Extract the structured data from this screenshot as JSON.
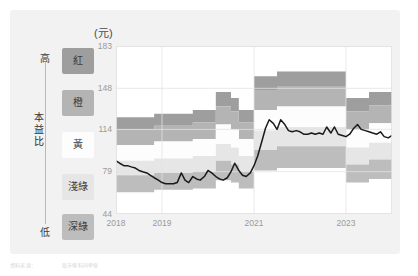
{
  "card": {
    "background": "#f2f2f2"
  },
  "legend": {
    "title_vertical": "本益比",
    "title_chars": [
      "本",
      "益",
      "比"
    ],
    "high_label": "高",
    "low_label": "低",
    "bands": [
      {
        "label": "紅",
        "color": "#9e9e9e",
        "text_color": "#3c3c3c"
      },
      {
        "label": "橙",
        "color": "#b4b4b4",
        "text_color": "#3c3c3c"
      },
      {
        "label": "黃",
        "color": "#fdfdfd",
        "text_color": "#3c3c3c"
      },
      {
        "label": "淺綠",
        "color": "#e6e6e6",
        "text_color": "#3c3c3c"
      },
      {
        "label": "深綠",
        "color": "#bdbdbd",
        "text_color": "#3c3c3c"
      }
    ]
  },
  "chart_data": {
    "type": "area",
    "title": "",
    "subtitle": "",
    "unit_label": "(元)",
    "xlabel": "",
    "ylabel": "(元)",
    "ylim": [
      44,
      183
    ],
    "yticks": [
      44,
      79,
      114,
      148,
      183
    ],
    "ytick_labels": [
      "44",
      "79",
      "114",
      "148",
      "183"
    ],
    "xlim": [
      2018.0,
      2024.0
    ],
    "xticks": [
      2018,
      2019,
      2021,
      2023
    ],
    "xtick_labels": [
      "2018",
      "2019",
      "2021",
      "2023"
    ],
    "grid": true,
    "legend_position": "left-outside",
    "stacked_band_order_top_to_bottom": [
      "紅",
      "橙",
      "黃",
      "淺綠",
      "深綠"
    ],
    "x": [
      2018.0,
      2018.17,
      2018.33,
      2018.5,
      2018.67,
      2018.83,
      2019.0,
      2019.17,
      2019.33,
      2019.5,
      2019.67,
      2019.83,
      2020.0,
      2020.17,
      2020.33,
      2020.5,
      2020.67,
      2020.83,
      2021.0,
      2021.17,
      2021.33,
      2021.5,
      2021.67,
      2021.83,
      2022.0,
      2022.17,
      2022.33,
      2022.5,
      2022.67,
      2022.83,
      2023.0,
      2023.17,
      2023.33,
      2023.5,
      2023.67,
      2023.83,
      2024.0
    ],
    "series": [
      {
        "name": "band-top-紅-upper",
        "values": [
          124,
          124,
          124,
          124,
          124,
          127,
          127,
          127,
          127,
          127,
          130,
          130,
          130,
          145,
          145,
          140,
          130,
          130,
          158,
          158,
          158,
          162,
          162,
          162,
          162,
          162,
          162,
          162,
          162,
          162,
          140,
          140,
          140,
          145,
          145,
          145,
          145
        ]
      },
      {
        "name": "band-紅/橙-boundary",
        "values": [
          114,
          114,
          114,
          114,
          114,
          117,
          117,
          117,
          117,
          117,
          120,
          120,
          120,
          133,
          133,
          129,
          120,
          120,
          146,
          146,
          146,
          150,
          150,
          150,
          150,
          150,
          150,
          150,
          150,
          150,
          129,
          129,
          129,
          134,
          134,
          134,
          134
        ]
      },
      {
        "name": "band-橙/黃-boundary",
        "values": [
          101,
          101,
          101,
          101,
          101,
          104,
          104,
          104,
          104,
          104,
          106,
          106,
          106,
          118,
          118,
          114,
          106,
          106,
          130,
          130,
          130,
          133,
          133,
          133,
          133,
          133,
          133,
          133,
          133,
          133,
          114,
          114,
          114,
          119,
          119,
          119,
          119
        ]
      },
      {
        "name": "band-黃/淺綠-boundary",
        "values": [
          88,
          88,
          88,
          88,
          88,
          90,
          90,
          90,
          90,
          90,
          92,
          92,
          92,
          102,
          102,
          99,
          92,
          92,
          113,
          113,
          113,
          116,
          116,
          116,
          116,
          116,
          116,
          116,
          116,
          116,
          99,
          99,
          99,
          103,
          103,
          103,
          103
        ]
      },
      {
        "name": "band-淺綠/深綠-boundary",
        "values": [
          76,
          76,
          76,
          76,
          76,
          78,
          78,
          78,
          78,
          78,
          79,
          79,
          79,
          88,
          88,
          85,
          79,
          79,
          97,
          97,
          97,
          100,
          100,
          100,
          100,
          100,
          100,
          100,
          100,
          100,
          85,
          85,
          85,
          89,
          89,
          89,
          89
        ]
      },
      {
        "name": "band-bottom-深綠-lower",
        "values": [
          62,
          62,
          62,
          62,
          62,
          64,
          64,
          64,
          64,
          64,
          65,
          65,
          65,
          72,
          72,
          70,
          65,
          65,
          80,
          80,
          80,
          82,
          82,
          82,
          82,
          82,
          82,
          82,
          82,
          82,
          70,
          70,
          70,
          73,
          73,
          73,
          73
        ]
      }
    ],
    "price_line": {
      "name": "股價",
      "color": "#1a1a1a",
      "x": [
        2018.0,
        2018.08,
        2018.17,
        2018.25,
        2018.33,
        2018.42,
        2018.5,
        2018.58,
        2018.67,
        2018.75,
        2018.83,
        2018.92,
        2019.0,
        2019.08,
        2019.17,
        2019.25,
        2019.33,
        2019.42,
        2019.5,
        2019.58,
        2019.67,
        2019.75,
        2019.83,
        2019.92,
        2020.0,
        2020.08,
        2020.17,
        2020.25,
        2020.33,
        2020.42,
        2020.5,
        2020.58,
        2020.67,
        2020.75,
        2020.83,
        2020.92,
        2021.0,
        2021.08,
        2021.17,
        2021.25,
        2021.33,
        2021.42,
        2021.5,
        2021.58,
        2021.67,
        2021.75,
        2021.83,
        2021.92,
        2022.0,
        2022.08,
        2022.17,
        2022.25,
        2022.33,
        2022.42,
        2022.5,
        2022.58,
        2022.67,
        2022.75,
        2022.83,
        2022.92,
        2023.0,
        2023.08,
        2023.17,
        2023.25,
        2023.33,
        2023.42,
        2023.5,
        2023.58,
        2023.67,
        2023.75,
        2023.83,
        2023.92,
        2024.0
      ],
      "values": [
        88,
        86,
        84,
        84,
        83,
        82,
        80,
        79,
        78,
        76,
        74,
        72,
        70,
        69,
        69,
        69,
        70,
        78,
        72,
        70,
        75,
        73,
        72,
        75,
        80,
        78,
        75,
        73,
        72,
        74,
        79,
        86,
        80,
        76,
        75,
        78,
        84,
        92,
        104,
        115,
        122,
        119,
        114,
        122,
        118,
        113,
        112,
        113,
        112,
        110,
        110,
        111,
        110,
        111,
        110,
        116,
        111,
        116,
        110,
        109,
        108,
        110,
        115,
        118,
        114,
        113,
        112,
        111,
        110,
        112,
        108,
        107,
        109
      ]
    }
  },
  "footer": {
    "line1": "資料來源：",
    "line2": "股市爆料同學會"
  }
}
